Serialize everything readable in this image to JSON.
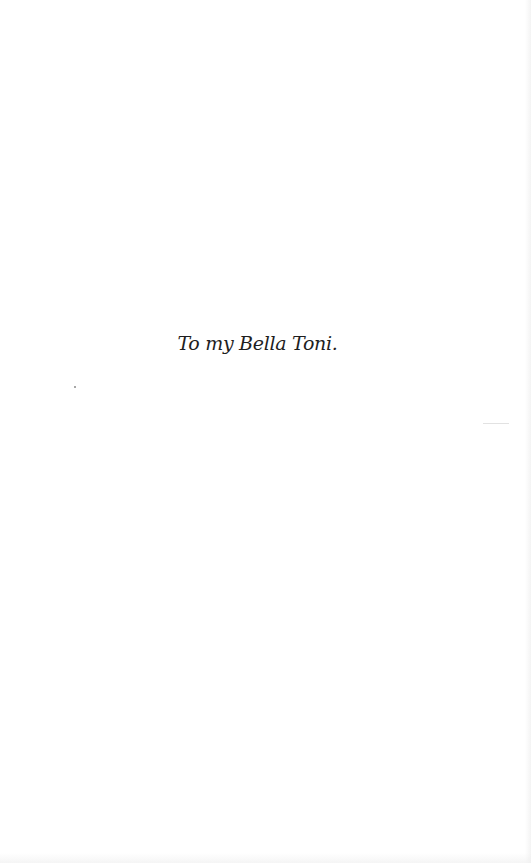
{
  "page": {
    "type": "dedication",
    "text": "To my Bella Toni.",
    "background_color": "#ffffff",
    "text_color": "#1e1e1e"
  }
}
